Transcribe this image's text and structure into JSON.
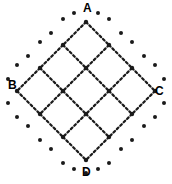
{
  "figure": {
    "type": "lattice-diagram",
    "title": "",
    "background_color": "#ffffff",
    "ink_color": "#1a1a1a",
    "width": 172,
    "height": 184,
    "labels": [
      {
        "id": "A",
        "text": "A",
        "position": "top",
        "x": 83,
        "y": 2
      },
      {
        "id": "B",
        "text": "B",
        "position": "left",
        "x": 8,
        "y": 79
      },
      {
        "id": "C",
        "text": "C",
        "position": "right",
        "x": 155,
        "y": 85
      },
      {
        "id": "D",
        "text": "D",
        "position": "bottom",
        "x": 82,
        "y": 166
      }
    ],
    "geometry": {
      "center_x": 86,
      "center_y": 91,
      "cell_half_diagonal": 23,
      "grid_rotation_deg": 45,
      "grid_order": 4,
      "center_cell_empty": true
    },
    "style": {
      "line_dash": "2.2 2.6",
      "line_width": 2.2,
      "node_radius": 2.2,
      "halo_dot_radius": 2.0
    },
    "nodes": [
      {
        "x": 86,
        "y": 22
      },
      {
        "x": 63,
        "y": 45
      },
      {
        "x": 109,
        "y": 45
      },
      {
        "x": 40,
        "y": 68
      },
      {
        "x": 86,
        "y": 68
      },
      {
        "x": 132,
        "y": 68
      },
      {
        "x": 17,
        "y": 91
      },
      {
        "x": 63,
        "y": 91
      },
      {
        "x": 109,
        "y": 91
      },
      {
        "x": 155,
        "y": 91
      },
      {
        "x": 40,
        "y": 114
      },
      {
        "x": 86,
        "y": 114
      },
      {
        "x": 132,
        "y": 114
      },
      {
        "x": 63,
        "y": 137
      },
      {
        "x": 109,
        "y": 137
      },
      {
        "x": 86,
        "y": 160
      }
    ],
    "halo_dots": [
      {
        "x": 63,
        "y": 19
      },
      {
        "x": 109,
        "y": 19
      },
      {
        "x": 40,
        "y": 42
      },
      {
        "x": 132,
        "y": 42
      },
      {
        "x": 17,
        "y": 65
      },
      {
        "x": 155,
        "y": 65
      },
      {
        "x": 74,
        "y": 13
      },
      {
        "x": 98,
        "y": 13
      },
      {
        "x": 51,
        "y": 33
      },
      {
        "x": 121,
        "y": 33
      },
      {
        "x": 28,
        "y": 56
      },
      {
        "x": 144,
        "y": 56
      },
      {
        "x": 8,
        "y": 79
      },
      {
        "x": 164,
        "y": 79
      },
      {
        "x": 8,
        "y": 103
      },
      {
        "x": 164,
        "y": 103
      },
      {
        "x": 28,
        "y": 126
      },
      {
        "x": 144,
        "y": 126
      },
      {
        "x": 51,
        "y": 149
      },
      {
        "x": 121,
        "y": 149
      },
      {
        "x": 74,
        "y": 169
      },
      {
        "x": 98,
        "y": 169
      },
      {
        "x": 63,
        "y": 163
      },
      {
        "x": 109,
        "y": 163
      },
      {
        "x": 40,
        "y": 140
      },
      {
        "x": 132,
        "y": 140
      },
      {
        "x": 17,
        "y": 117
      },
      {
        "x": 155,
        "y": 117
      },
      {
        "x": 86,
        "y": 173
      }
    ]
  }
}
